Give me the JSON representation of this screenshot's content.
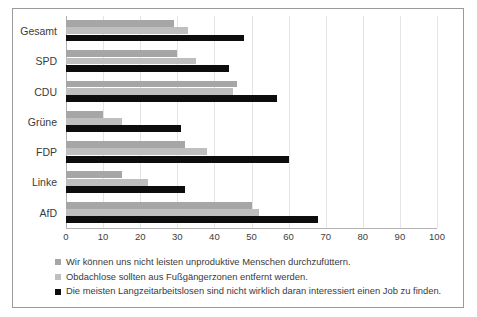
{
  "chart_data": {
    "type": "bar",
    "orientation": "horizontal",
    "title": "",
    "xlabel": "",
    "ylabel": "",
    "xlim": [
      0,
      100
    ],
    "xticks": [
      0,
      10,
      20,
      30,
      40,
      50,
      60,
      70,
      80,
      90,
      100
    ],
    "grid": true,
    "legend_position": "bottom-left",
    "categories": [
      "Gesamt",
      "SPD",
      "CDU",
      "Grüne",
      "FDP",
      "Linke",
      "AfD"
    ],
    "series": [
      {
        "name": "Wir können uns nicht leisten unproduktive Menschen durchzufüttern.",
        "color": "#a6a6a6",
        "values": [
          29,
          30,
          46,
          10,
          32,
          15,
          50
        ]
      },
      {
        "name": "Obdachlose sollten aus Fußgängerzonen entfernt werden.",
        "color": "#bfbfbf",
        "values": [
          33,
          35,
          45,
          15,
          38,
          22,
          52
        ]
      },
      {
        "name": "Die meisten Langzeitarbeitslosen sind nicht wirklich daran interessiert einen Job zu finden.",
        "color": "#0d0d0d",
        "values": [
          48,
          44,
          57,
          31,
          60,
          32,
          68
        ]
      }
    ]
  },
  "axis": {
    "tick_labels": [
      "0",
      "10",
      "20",
      "30",
      "40",
      "50",
      "60",
      "70",
      "80",
      "90",
      "100"
    ]
  },
  "legend": {
    "items": [
      {
        "marker": "legend-swatch-series-1",
        "label": "Wir können uns nicht leisten unproduktive Menschen durchzufüttern."
      },
      {
        "marker": "legend-swatch-series-2",
        "label": "Obdachlose sollten aus Fußgängerzonen entfernt werden."
      },
      {
        "marker": "legend-swatch-series-3",
        "label": "Die meisten Langzeitarbeitslosen sind nicht wirklich daran interessiert einen Job zu finden."
      }
    ]
  },
  "colors": {
    "series_1": "#a6a6a6",
    "series_2": "#bfbfbf",
    "series_3": "#0d0d0d",
    "grid": "#e4e4e4",
    "border": "#9a9a9a",
    "text": "#3a3a3a"
  }
}
